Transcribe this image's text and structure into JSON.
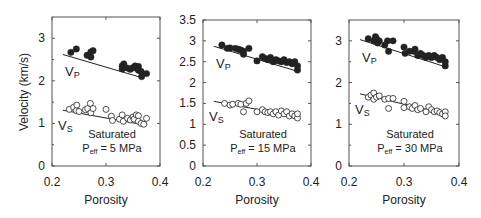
{
  "figure": {
    "ylabel": "Velocity (km/s)",
    "xlabel": "Porosity",
    "colors": {
      "ink": "#222222",
      "frame": "#555555",
      "background": "#ffffff"
    }
  },
  "chart_data": [
    {
      "type": "scatter",
      "title": "Saturated Peff = 5 MPa",
      "annotation": {
        "line1": "Saturated",
        "line2_prefix": "P",
        "line2_sub": "eff",
        "line2_suffix": " = 5 MPa"
      },
      "xlabel": "Porosity",
      "ylabel": "Velocity (km/s)",
      "xlim": [
        0.2,
        0.4
      ],
      "ylim": [
        0,
        3.5
      ],
      "xticks": [
        "0.2",
        "0.3",
        "0.4"
      ],
      "yticks": [
        "0",
        "1",
        "2",
        "3"
      ],
      "series_labels": {
        "vp": "V",
        "vp_sub": "P",
        "vs": "V",
        "vs_sub": "S"
      },
      "series": [
        {
          "name": "Vp",
          "marker": "filled-circle",
          "points": [
            [
              0.235,
              2.67
            ],
            [
              0.245,
              2.75
            ],
            [
              0.265,
              2.6
            ],
            [
              0.272,
              2.56
            ],
            [
              0.272,
              2.68
            ],
            [
              0.276,
              2.71
            ],
            [
              0.33,
              2.35
            ],
            [
              0.33,
              2.28
            ],
            [
              0.333,
              2.4
            ],
            [
              0.34,
              2.3
            ],
            [
              0.345,
              2.27
            ],
            [
              0.35,
              2.31
            ],
            [
              0.354,
              2.35
            ],
            [
              0.356,
              2.3
            ],
            [
              0.36,
              2.34
            ],
            [
              0.36,
              2.25
            ],
            [
              0.365,
              2.22
            ],
            [
              0.366,
              2.1
            ],
            [
              0.375,
              2.17
            ]
          ],
          "fit": [
            [
              0.22,
              2.62
            ],
            [
              0.365,
              2.08
            ]
          ]
        },
        {
          "name": "Vs",
          "marker": "open-circle",
          "points": [
            [
              0.232,
              1.33
            ],
            [
              0.24,
              1.38
            ],
            [
              0.245,
              1.3
            ],
            [
              0.246,
              1.43
            ],
            [
              0.25,
              1.28
            ],
            [
              0.262,
              1.32
            ],
            [
              0.266,
              1.35
            ],
            [
              0.271,
              1.47
            ],
            [
              0.272,
              1.25
            ],
            [
              0.276,
              1.35
            ],
            [
              0.3,
              1.33
            ],
            [
              0.31,
              1.17
            ],
            [
              0.312,
              1.07
            ],
            [
              0.325,
              1.1
            ],
            [
              0.33,
              1.2
            ],
            [
              0.332,
              1.05
            ],
            [
              0.34,
              1.12
            ],
            [
              0.345,
              1.08
            ],
            [
              0.35,
              1.15
            ],
            [
              0.352,
              1.1
            ],
            [
              0.356,
              1.2
            ],
            [
              0.36,
              1.18
            ],
            [
              0.36,
              1.05
            ],
            [
              0.365,
              1.0
            ],
            [
              0.37,
              0.98
            ],
            [
              0.375,
              1.12
            ]
          ],
          "fit": [
            [
              0.22,
              1.31
            ],
            [
              0.365,
              0.98
            ]
          ]
        }
      ]
    },
    {
      "type": "scatter",
      "title": "Saturated Peff = 15 MPa",
      "annotation": {
        "line1": "Saturated",
        "line2_prefix": "P",
        "line2_sub": "eff",
        "line2_suffix": " = 15 MPa"
      },
      "xlabel": "Porosity",
      "ylabel": "",
      "xlim": [
        0.2,
        0.4
      ],
      "ylim": [
        0,
        3.5
      ],
      "xticks": [
        "0.2",
        "0.3",
        "0.4"
      ],
      "yticks": [
        "0",
        "0.5",
        "1",
        "1.5",
        "2",
        "2.5",
        "3",
        "3.5"
      ],
      "series_labels": {
        "vp": "V",
        "vp_sub": "P",
        "vs": "V",
        "vs_sub": "S"
      },
      "series": [
        {
          "name": "Vp",
          "marker": "filled-circle",
          "points": [
            [
              0.235,
              2.9
            ],
            [
              0.245,
              2.82
            ],
            [
              0.25,
              2.83
            ],
            [
              0.26,
              2.82
            ],
            [
              0.265,
              2.8
            ],
            [
              0.27,
              2.78
            ],
            [
              0.275,
              2.68
            ],
            [
              0.275,
              2.75
            ],
            [
              0.285,
              2.82
            ],
            [
              0.3,
              2.52
            ],
            [
              0.31,
              2.62
            ],
            [
              0.315,
              2.58
            ],
            [
              0.32,
              2.55
            ],
            [
              0.325,
              2.6
            ],
            [
              0.33,
              2.5
            ],
            [
              0.335,
              2.55
            ],
            [
              0.34,
              2.52
            ],
            [
              0.345,
              2.5
            ],
            [
              0.35,
              2.55
            ],
            [
              0.355,
              2.48
            ],
            [
              0.36,
              2.5
            ],
            [
              0.365,
              2.45
            ],
            [
              0.37,
              2.5
            ],
            [
              0.375,
              2.4
            ],
            [
              0.375,
              2.3
            ]
          ],
          "fit": [
            [
              0.22,
              2.87
            ],
            [
              0.375,
              2.27
            ]
          ]
        },
        {
          "name": "Vs",
          "marker": "open-circle",
          "points": [
            [
              0.24,
              1.5
            ],
            [
              0.25,
              1.46
            ],
            [
              0.255,
              1.48
            ],
            [
              0.265,
              1.5
            ],
            [
              0.27,
              1.48
            ],
            [
              0.275,
              1.3
            ],
            [
              0.28,
              1.5
            ],
            [
              0.285,
              1.56
            ],
            [
              0.3,
              1.3
            ],
            [
              0.31,
              1.35
            ],
            [
              0.315,
              1.3
            ],
            [
              0.32,
              1.28
            ],
            [
              0.325,
              1.3
            ],
            [
              0.33,
              1.25
            ],
            [
              0.335,
              1.3
            ],
            [
              0.34,
              1.22
            ],
            [
              0.345,
              1.32
            ],
            [
              0.35,
              1.25
            ],
            [
              0.355,
              1.3
            ],
            [
              0.36,
              1.2
            ],
            [
              0.365,
              1.25
            ],
            [
              0.37,
              1.2
            ],
            [
              0.375,
              1.15
            ],
            [
              0.375,
              1.25
            ]
          ],
          "fit": [
            [
              0.22,
              1.55
            ],
            [
              0.375,
              1.18
            ]
          ]
        }
      ]
    },
    {
      "type": "scatter",
      "title": "Saturated Peff = 30 MPa",
      "annotation": {
        "line1": "Saturated",
        "line2_prefix": "P",
        "line2_sub": "eff",
        "line2_suffix": " = 30 MPa"
      },
      "xlabel": "Porosity",
      "ylabel": "",
      "xlim": [
        0.2,
        0.4
      ],
      "ylim": [
        0,
        3.5
      ],
      "xticks": [
        "0.2",
        "0.3",
        "0.4"
      ],
      "yticks": [
        "0",
        "1",
        "2",
        "3"
      ],
      "series_labels": {
        "vp": "V",
        "vp_sub": "P",
        "vs": "V",
        "vs_sub": "S"
      },
      "series": [
        {
          "name": "Vp",
          "marker": "filled-circle",
          "points": [
            [
              0.235,
              3.05
            ],
            [
              0.245,
              3.0
            ],
            [
              0.248,
              3.1
            ],
            [
              0.25,
              3.05
            ],
            [
              0.252,
              2.95
            ],
            [
              0.255,
              3.0
            ],
            [
              0.265,
              2.9
            ],
            [
              0.27,
              3.0
            ],
            [
              0.272,
              2.75
            ],
            [
              0.28,
              3.0
            ],
            [
              0.3,
              2.85
            ],
            [
              0.302,
              2.7
            ],
            [
              0.31,
              2.75
            ],
            [
              0.318,
              2.75
            ],
            [
              0.32,
              2.8
            ],
            [
              0.325,
              2.65
            ],
            [
              0.33,
              2.7
            ],
            [
              0.335,
              2.65
            ],
            [
              0.34,
              2.6
            ],
            [
              0.345,
              2.65
            ],
            [
              0.35,
              2.6
            ],
            [
              0.355,
              2.65
            ],
            [
              0.36,
              2.6
            ],
            [
              0.365,
              2.55
            ],
            [
              0.37,
              2.6
            ],
            [
              0.375,
              2.5
            ],
            [
              0.375,
              2.4
            ]
          ],
          "fit": [
            [
              0.22,
              3.03
            ],
            [
              0.375,
              2.38
            ]
          ]
        },
        {
          "name": "Vs",
          "marker": "open-circle",
          "points": [
            [
              0.235,
              1.65
            ],
            [
              0.24,
              1.7
            ],
            [
              0.245,
              1.6
            ],
            [
              0.245,
              1.75
            ],
            [
              0.25,
              1.65
            ],
            [
              0.255,
              1.68
            ],
            [
              0.265,
              1.6
            ],
            [
              0.272,
              1.62
            ],
            [
              0.272,
              1.38
            ],
            [
              0.28,
              1.62
            ],
            [
              0.3,
              1.55
            ],
            [
              0.3,
              1.4
            ],
            [
              0.31,
              1.42
            ],
            [
              0.315,
              1.38
            ],
            [
              0.32,
              1.45
            ],
            [
              0.325,
              1.35
            ],
            [
              0.33,
              1.38
            ],
            [
              0.34,
              1.3
            ],
            [
              0.345,
              1.42
            ],
            [
              0.35,
              1.35
            ],
            [
              0.355,
              1.3
            ],
            [
              0.36,
              1.32
            ],
            [
              0.365,
              1.28
            ],
            [
              0.37,
              1.25
            ],
            [
              0.375,
              1.3
            ],
            [
              0.375,
              1.2
            ]
          ],
          "fit": [
            [
              0.22,
              1.73
            ],
            [
              0.375,
              1.25
            ]
          ]
        }
      ]
    }
  ],
  "layout": {
    "panels": [
      {
        "left": 52,
        "top": 17,
        "right": 160,
        "bottom": 166
      },
      {
        "left": 203,
        "top": 20,
        "right": 311,
        "bottom": 166
      },
      {
        "left": 349,
        "top": 20,
        "right": 459,
        "bottom": 166
      }
    ]
  }
}
